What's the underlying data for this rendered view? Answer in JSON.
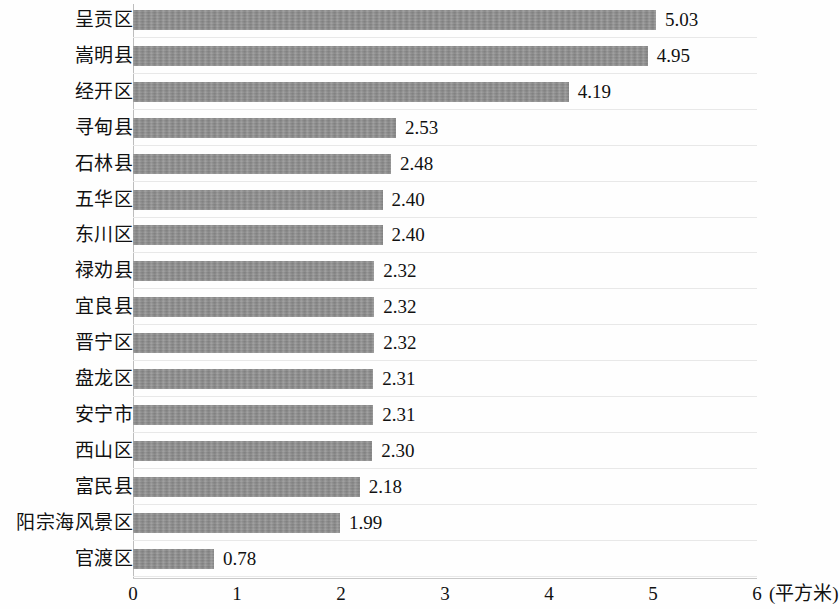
{
  "chart_data": {
    "type": "bar",
    "orientation": "horizontal",
    "title": "",
    "xlabel": "(平方米)",
    "ylabel": "",
    "unit": "平方米",
    "xlim": [
      0,
      6
    ],
    "xticks": [
      "0",
      "1",
      "2",
      "3",
      "4",
      "5",
      "6"
    ],
    "grid": "horizontal",
    "legend": "none",
    "bar_color": "#8d8d8d",
    "categories": [
      "呈贡区",
      "嵩明县",
      "经开区",
      "寻甸县",
      "石林县",
      "五华区",
      "东川区",
      "禄劝县",
      "宜良县",
      "晋宁区",
      "盘龙区",
      "安宁市",
      "西山区",
      "富民县",
      "阳宗海风景区",
      "官渡区"
    ],
    "values": [
      5.03,
      4.95,
      4.19,
      2.53,
      2.48,
      2.4,
      2.4,
      2.32,
      2.32,
      2.32,
      2.31,
      2.31,
      2.3,
      2.18,
      1.99,
      0.78
    ],
    "value_labels": [
      "5.03",
      "4.95",
      "4.19",
      "2.53",
      "2.48",
      "2.40",
      "2.40",
      "2.32",
      "2.32",
      "2.32",
      "2.31",
      "2.31",
      "2.30",
      "2.18",
      "1.99",
      "0.78"
    ]
  }
}
